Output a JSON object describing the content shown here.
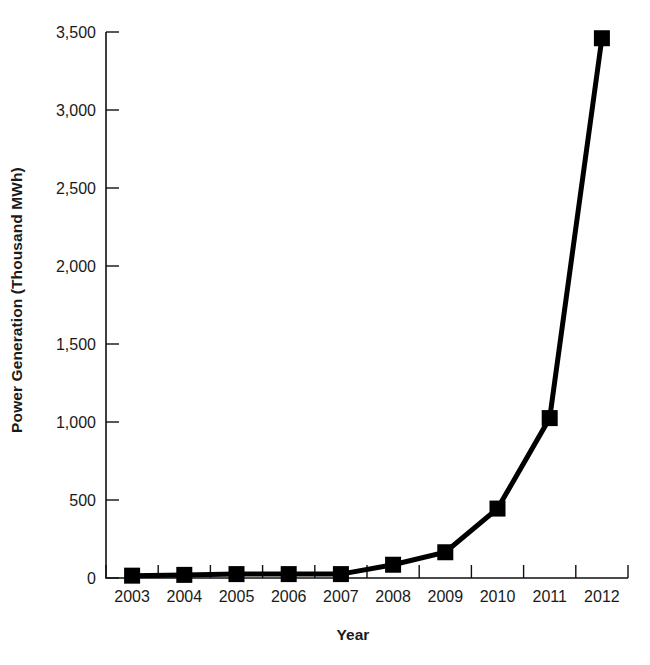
{
  "chart_data": {
    "type": "line",
    "title": "",
    "xlabel": "Year",
    "ylabel": "Power Generation (Thousand MWh)",
    "categories": [
      "2003",
      "2004",
      "2005",
      "2006",
      "2007",
      "2008",
      "2009",
      "2010",
      "2011",
      "2012"
    ],
    "x": [
      2003,
      2004,
      2005,
      2006,
      2007,
      2008,
      2009,
      2010,
      2011,
      2012
    ],
    "values": [
      15,
      20,
      25,
      25,
      25,
      85,
      165,
      445,
      1025,
      3460
    ],
    "series": [
      {
        "name": "Power Generation",
        "values": [
          15,
          20,
          25,
          25,
          25,
          85,
          165,
          445,
          1025,
          3460
        ]
      }
    ],
    "ylim": [
      0,
      3500
    ],
    "yticks": [
      0,
      500,
      1000,
      1500,
      2000,
      2500,
      3000,
      3500
    ],
    "ytick_labels": [
      "0",
      "500",
      "1,000",
      "1,500",
      "2,000",
      "2,500",
      "3,000",
      "3,500"
    ],
    "xtick_labels": [
      "2003",
      "2004",
      "2005",
      "2006",
      "2007",
      "2008",
      "2009",
      "2010",
      "2011",
      "2012"
    ],
    "grid": false,
    "legend": "none",
    "marker": "square",
    "line_color": "#000000",
    "marker_color": "#000000",
    "background_color": "#ffffff",
    "line_width": 5,
    "marker_size": 16
  },
  "axes": {
    "y_title": "Power Generation (Thousand MWh)",
    "x_title": "Year"
  }
}
